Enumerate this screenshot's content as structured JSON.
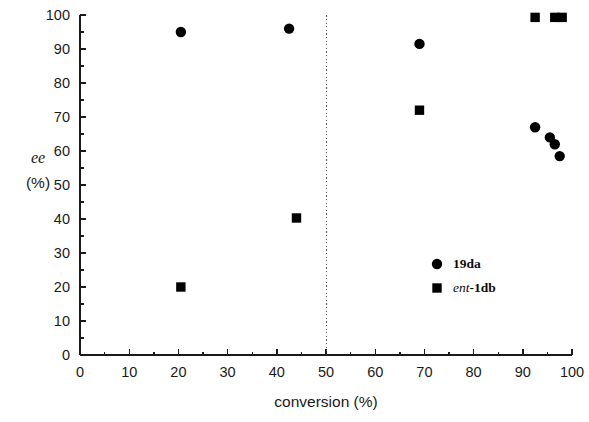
{
  "chart_data": {
    "type": "scatter",
    "title": "",
    "xlabel": "conversion (%)",
    "ylabel_line1": "ee",
    "ylabel_line2": "(%)",
    "ylabel": "ee (%)",
    "xlim": [
      0,
      100
    ],
    "ylim": [
      0,
      100
    ],
    "xticks": [
      0,
      10,
      20,
      30,
      40,
      50,
      60,
      70,
      80,
      90,
      100
    ],
    "yticks": [
      0,
      10,
      20,
      30,
      40,
      50,
      60,
      70,
      80,
      90,
      100
    ],
    "xtick_labels": [
      "0",
      "10",
      "20",
      "30",
      "40",
      "50",
      "60",
      "70",
      "80",
      "90",
      "100"
    ],
    "ytick_labels": [
      "0",
      "10",
      "20",
      "30",
      "40",
      "50",
      "60",
      "70",
      "80",
      "90",
      "100"
    ],
    "minor_tick_step": 5,
    "grid": false,
    "legend_position": "center-right",
    "annotations": [
      {
        "name": "fifty-percent-conversion-line",
        "type": "vline",
        "x": 50,
        "style": "dotted"
      }
    ],
    "series": [
      {
        "name": "19da",
        "label": "19da",
        "marker": "circle",
        "color": "#000000",
        "points": [
          {
            "x": 20.5,
            "y": 95.0
          },
          {
            "x": 42.5,
            "y": 96.0
          },
          {
            "x": 69.0,
            "y": 91.5
          },
          {
            "x": 92.5,
            "y": 67.0
          },
          {
            "x": 95.5,
            "y": 64.0
          },
          {
            "x": 96.5,
            "y": 62.0
          },
          {
            "x": 97.5,
            "y": 58.5
          }
        ]
      },
      {
        "name": "ent-1db",
        "label_italic": "ent",
        "label_rest": "-1db",
        "label": "ent-1db",
        "marker": "square",
        "color": "#000000",
        "points": [
          {
            "x": 20.5,
            "y": 20.0
          },
          {
            "x": 44.0,
            "y": 40.3
          },
          {
            "x": 69.0,
            "y": 72.0
          },
          {
            "x": 92.5,
            "y": 99.3
          },
          {
            "x": 96.5,
            "y": 99.3
          },
          {
            "x": 98.0,
            "y": 99.3
          }
        ]
      }
    ]
  }
}
